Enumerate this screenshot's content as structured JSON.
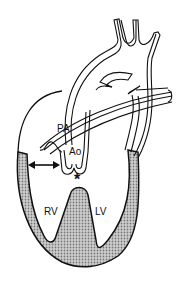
{
  "diagram": {
    "type": "anatomical-heart-schematic",
    "labels": {
      "pa": "PA",
      "ao": "Ao",
      "rv": "RV",
      "lv": "LV",
      "asterisk": "*"
    },
    "colors": {
      "line": "#111111",
      "myocardium_fill": "#b8b8b8",
      "background": "#ffffff"
    }
  }
}
